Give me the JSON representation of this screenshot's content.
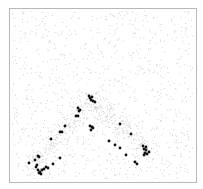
{
  "chart_data": {
    "type": "scatter",
    "title": "",
    "xlabel": "",
    "ylabel": "",
    "grid": false,
    "legend": null,
    "frame": {
      "x": 9,
      "y": 8,
      "width": 187,
      "height": 174,
      "color": "#b8b8b8"
    },
    "background_points": {
      "count": 1400,
      "color": "#cfcfcf",
      "radius": 0.55,
      "description": "uniform gray noise points with denser band along the inverted-V"
    },
    "series": [
      {
        "name": "highlighted",
        "color": "#111111",
        "radius": 1.4,
        "points": [
          [
            89,
            96
          ],
          [
            90,
            98
          ],
          [
            92,
            97
          ],
          [
            93,
            101
          ],
          [
            95,
            102
          ],
          [
            91,
            100
          ],
          [
            78,
            108
          ],
          [
            80,
            110
          ],
          [
            79,
            111
          ],
          [
            76,
            116
          ],
          [
            78,
            116
          ],
          [
            90,
            126
          ],
          [
            92,
            127
          ],
          [
            91,
            130
          ],
          [
            93,
            128
          ],
          [
            65,
            126
          ],
          [
            60,
            132
          ],
          [
            62,
            132
          ],
          [
            51,
            139
          ],
          [
            38,
            156
          ],
          [
            35,
            160
          ],
          [
            39,
            157
          ],
          [
            29,
            163
          ],
          [
            36,
            167
          ],
          [
            38,
            170
          ],
          [
            40,
            172
          ],
          [
            42,
            170
          ],
          [
            44,
            169
          ],
          [
            46,
            167
          ],
          [
            48,
            168
          ],
          [
            41,
            174
          ],
          [
            39,
            173
          ],
          [
            37,
            165
          ],
          [
            53,
            164
          ],
          [
            60,
            158
          ],
          [
            120,
            124
          ],
          [
            131,
            134
          ],
          [
            109,
            141
          ],
          [
            115,
            145
          ],
          [
            120,
            148
          ],
          [
            126,
            155
          ],
          [
            135,
            162
          ],
          [
            137,
            164
          ],
          [
            143,
            146
          ],
          [
            144,
            149
          ],
          [
            146,
            150
          ],
          [
            145,
            153
          ],
          [
            147,
            154
          ],
          [
            149,
            152
          ],
          [
            146,
            147
          ],
          [
            144,
            155
          ]
        ]
      }
    ]
  }
}
